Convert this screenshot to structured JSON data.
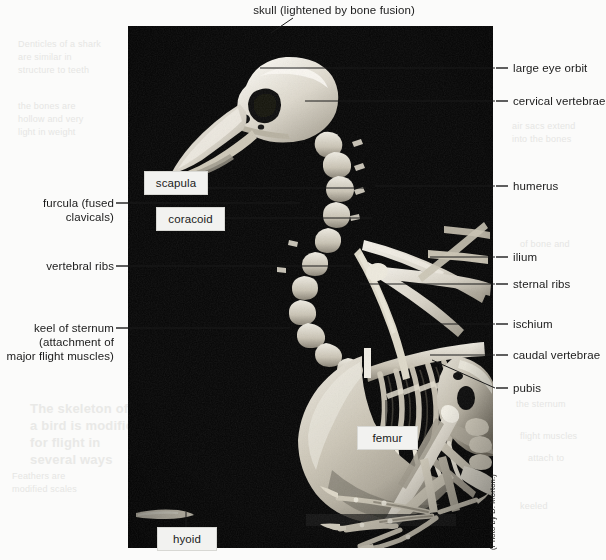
{
  "figure": {
    "type": "anatomical-photo-diagram",
    "photo_credit": "(Photo by D. Morton.)",
    "background_color": "#fbfbfa",
    "plate_color": "#080808",
    "leader_color": "#1b1b1b",
    "text_color": "#1a1a1a"
  },
  "labels": {
    "top": [
      {
        "id": "skull",
        "text": "skull (lightened by bone fusion)"
      }
    ],
    "left": [
      {
        "id": "furcula",
        "line1": "furcula (fused",
        "line2": "clavicals)"
      },
      {
        "id": "vertebral-ribs",
        "line1": "vertebral ribs"
      },
      {
        "id": "keel",
        "line1": "keel of sternum",
        "line2": "(attachment of",
        "line3": "major flight muscles)"
      }
    ],
    "right": [
      {
        "id": "large-eye-orbit",
        "text": "large eye orbit"
      },
      {
        "id": "cervical-vertebrae",
        "text": "cervical vertebrae"
      },
      {
        "id": "humerus",
        "text": "humerus"
      },
      {
        "id": "ilium",
        "text": "ilium"
      },
      {
        "id": "sternal-ribs",
        "text": "sternal ribs"
      },
      {
        "id": "ischium",
        "text": "ischium"
      },
      {
        "id": "caudal-vertebrae",
        "text": "caudal vertebrae"
      },
      {
        "id": "pubis",
        "text": "pubis"
      }
    ],
    "boxes": [
      {
        "id": "scapula",
        "text": "scapula"
      },
      {
        "id": "coracoid",
        "text": "coracoid"
      },
      {
        "id": "femur",
        "text": "femur"
      },
      {
        "id": "hyoid",
        "text": "hyoid"
      }
    ]
  },
  "bleed": {
    "b1": "Denticles of a shark\nare similar in\nstructure to teeth",
    "b2": "the bones are\nhollow and very\nlight in weight",
    "b3": "The skeleton of\na bird is modified\nfor flight in\nseveral ways",
    "b4": "Feathers are\nmodified scales",
    "b5": "air sacs extend\ninto the bones",
    "b6": "of bone and",
    "b7": "the sternum",
    "b8": "flight muscles",
    "b9": "attach to",
    "b10": "keeled"
  }
}
